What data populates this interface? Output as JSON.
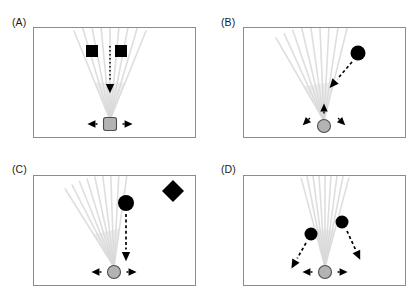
{
  "figure": {
    "width": 418,
    "height": 295,
    "background_color": "#ffffff",
    "frame_color": "#8c8c8c",
    "agent_fill_color": "#b3b3b3",
    "agent_stroke_color": "#4d4d4d",
    "obstacle_color": "#000000",
    "ray_color": "#d9d9d9",
    "arrow_color": "#000000"
  },
  "panels": [
    {
      "id": "A",
      "label": "(A)",
      "label_x": 12,
      "label_y": 16,
      "frame": {
        "x": 33,
        "y": 27,
        "width": 163,
        "height": 111
      },
      "agent": {
        "shape": "rounded-square",
        "x": 110,
        "y": 124,
        "size": 13
      },
      "agent_arrows": [
        {
          "direction": "left",
          "x": 92,
          "y": 124
        },
        {
          "direction": "right",
          "x": 128,
          "y": 124
        }
      ],
      "rays": {
        "origin_x": 110,
        "origin_y": 120,
        "count": 9,
        "spread_degrees": 44,
        "tilt_degrees": 0,
        "length": 96
      },
      "obstacles": [
        {
          "shape": "square",
          "x": 92,
          "y": 51,
          "size": 12
        },
        {
          "shape": "square",
          "x": 121,
          "y": 51,
          "size": 12
        }
      ],
      "motion_arrows": [
        {
          "style": "dotted-vertical",
          "x1": 110,
          "y1": 46,
          "x2": 110,
          "y2": 88,
          "head": "down"
        }
      ]
    },
    {
      "id": "B",
      "label": "(B)",
      "label_x": 221,
      "label_y": 16,
      "frame": {
        "x": 243,
        "y": 27,
        "width": 163,
        "height": 111
      },
      "agent": {
        "shape": "circle",
        "x": 324,
        "y": 126,
        "size": 13
      },
      "agent_arrows": [
        {
          "direction": "up",
          "x": 324,
          "y": 108
        },
        {
          "direction": "down-left",
          "x": 306,
          "y": 122
        },
        {
          "direction": "down-right",
          "x": 342,
          "y": 122
        }
      ],
      "rays": {
        "origin_x": 324,
        "origin_y": 121,
        "count": 9,
        "spread_degrees": 44,
        "tilt_degrees": -8,
        "length": 96
      },
      "obstacles": [
        {
          "shape": "circle",
          "x": 358,
          "y": 53,
          "size": 15
        }
      ],
      "motion_arrows": [
        {
          "style": "dashed-diagonal",
          "x1": 352,
          "y1": 62,
          "x2": 333,
          "y2": 84,
          "head": "down-left"
        }
      ]
    },
    {
      "id": "C",
      "label": "(C)",
      "label_x": 12,
      "label_y": 163,
      "frame": {
        "x": 33,
        "y": 175,
        "width": 163,
        "height": 111
      },
      "agent": {
        "shape": "circle",
        "x": 114,
        "y": 272,
        "size": 13
      },
      "agent_arrows": [
        {
          "direction": "left",
          "x": 96,
          "y": 272
        },
        {
          "direction": "right",
          "x": 132,
          "y": 272
        }
      ],
      "rays": {
        "origin_x": 114,
        "origin_y": 267,
        "count": 9,
        "spread_degrees": 40,
        "tilt_degrees": -12,
        "length": 92
      },
      "obstacles": [
        {
          "shape": "circle",
          "x": 126,
          "y": 203,
          "size": 16
        },
        {
          "shape": "diamond",
          "x": 173,
          "y": 191,
          "size": 22
        }
      ],
      "motion_arrows": [
        {
          "style": "dashed-vertical",
          "x1": 126,
          "y1": 214,
          "x2": 126,
          "y2": 256,
          "head": "down"
        }
      ]
    },
    {
      "id": "D",
      "label": "(D)",
      "label_x": 221,
      "label_y": 163,
      "frame": {
        "x": 243,
        "y": 175,
        "width": 163,
        "height": 111
      },
      "agent": {
        "shape": "circle",
        "x": 325,
        "y": 272,
        "size": 13
      },
      "agent_arrows": [
        {
          "direction": "left",
          "x": 307,
          "y": 272
        },
        {
          "direction": "right",
          "x": 343,
          "y": 272
        }
      ],
      "rays": {
        "origin_x": 325,
        "origin_y": 267,
        "count": 9,
        "spread_degrees": 30,
        "tilt_degrees": 0,
        "length": 92
      },
      "obstacles": [
        {
          "shape": "circle",
          "x": 311,
          "y": 234,
          "size": 13
        },
        {
          "shape": "circle",
          "x": 342,
          "y": 222,
          "size": 13
        }
      ],
      "motion_arrows": [
        {
          "style": "dashed-diagonal",
          "x1": 306,
          "y1": 243,
          "x2": 294,
          "y2": 264,
          "head": "down-left"
        },
        {
          "style": "dashed-diagonal",
          "x1": 347,
          "y1": 231,
          "x2": 358,
          "y2": 255,
          "head": "down-right"
        }
      ]
    }
  ]
}
